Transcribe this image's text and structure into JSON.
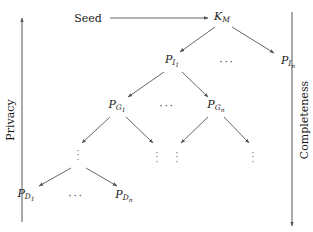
{
  "figure": {
    "type": "tree-diagram",
    "background_color": "#ffffff",
    "ink_color": "#1a1a1a",
    "line_color": "#555555"
  },
  "axes": {
    "left": {
      "label": "Privacy",
      "arrow_direction": "up",
      "x": 22,
      "y_top": 18,
      "y_bottom": 222
    },
    "right": {
      "label": "Completeness",
      "arrow_direction": "down",
      "x": 292,
      "y_top": 12,
      "y_bottom": 226
    }
  },
  "nodes": [
    {
      "id": "seed",
      "label": "Seed",
      "base": "Seed",
      "sub": "",
      "subsub": "",
      "style": "upright",
      "x": 88,
      "y": 18
    },
    {
      "id": "km",
      "label": "K_M",
      "base": "K",
      "sub": "M",
      "subsub": "",
      "style": "italic",
      "x": 222,
      "y": 17
    },
    {
      "id": "pi1",
      "label": "P_I1",
      "base": "P",
      "sub": "I",
      "subsub": "1",
      "style": "italic",
      "x": 172,
      "y": 61
    },
    {
      "id": "pin",
      "label": "P_In",
      "base": "P",
      "sub": "I",
      "subsub": "n",
      "style": "italic",
      "x": 288,
      "y": 62
    },
    {
      "id": "pg1",
      "label": "P_G1",
      "base": "P",
      "sub": "G",
      "subsub": "1",
      "style": "italic",
      "x": 117,
      "y": 106
    },
    {
      "id": "pgn",
      "label": "P_Gn",
      "base": "P",
      "sub": "G",
      "subsub": "n",
      "style": "italic",
      "x": 216,
      "y": 106
    },
    {
      "id": "pd1",
      "label": "P_D1",
      "base": "P",
      "sub": "D",
      "subsub": "1",
      "style": "italic",
      "x": 26,
      "y": 195
    },
    {
      "id": "pdn",
      "label": "P_Dn",
      "base": "P",
      "sub": "D",
      "subsub": "n",
      "style": "italic",
      "x": 124,
      "y": 196
    }
  ],
  "horizontal_ellipses": [
    {
      "id": "hdots-row-i",
      "text": "···",
      "x": 227,
      "y": 62
    },
    {
      "id": "hdots-row-g",
      "text": "···",
      "x": 167,
      "y": 106
    },
    {
      "id": "hdots-row-d",
      "text": "···",
      "x": 76,
      "y": 196
    }
  ],
  "vertical_ellipses": [
    {
      "id": "vdots-1",
      "x": 78,
      "y": 155
    },
    {
      "id": "vdots-2",
      "x": 157,
      "y": 157
    },
    {
      "id": "vdots-3",
      "x": 177,
      "y": 157
    },
    {
      "id": "vdots-4",
      "x": 253,
      "y": 157
    }
  ],
  "edges": [
    {
      "id": "seed-to-km",
      "kind": "horizontal-arrow",
      "from": "seed",
      "to": "km",
      "x1": 110,
      "y1": 18,
      "x2": 208,
      "y2": 18
    },
    {
      "id": "km-to-pi1",
      "kind": "arrow",
      "from": "km",
      "to": "pi1",
      "x1": 215,
      "y1": 27,
      "x2": 180,
      "y2": 52
    },
    {
      "id": "km-to-pin",
      "kind": "arrow",
      "from": "km",
      "to": "pin",
      "x1": 232,
      "y1": 27,
      "x2": 274,
      "y2": 53
    },
    {
      "id": "pi1-to-pg1",
      "kind": "arrow",
      "from": "pi1",
      "to": "pg1",
      "x1": 164,
      "y1": 72,
      "x2": 128,
      "y2": 97
    },
    {
      "id": "pi1-to-pgn",
      "kind": "arrow",
      "from": "pi1",
      "to": "pgn",
      "x1": 182,
      "y1": 72,
      "x2": 208,
      "y2": 97
    },
    {
      "id": "pg1-to-v1",
      "kind": "arrow",
      "from": "pg1",
      "to": "vdots-1",
      "x1": 110,
      "y1": 117,
      "x2": 82,
      "y2": 143
    },
    {
      "id": "pg1-to-v2",
      "kind": "arrow",
      "from": "pg1",
      "to": "vdots-2",
      "x1": 126,
      "y1": 117,
      "x2": 153,
      "y2": 143
    },
    {
      "id": "pgn-to-v3",
      "kind": "arrow",
      "from": "pgn",
      "to": "vdots-3",
      "x1": 208,
      "y1": 117,
      "x2": 181,
      "y2": 143
    },
    {
      "id": "pgn-to-v4",
      "kind": "arrow",
      "from": "pgn",
      "to": "vdots-4",
      "x1": 224,
      "y1": 117,
      "x2": 249,
      "y2": 143
    },
    {
      "id": "v1-to-pd1",
      "kind": "arrow",
      "from": "vdots-1",
      "to": "pd1",
      "x1": 71,
      "y1": 168,
      "x2": 39,
      "y2": 186
    },
    {
      "id": "v1-to-pdn",
      "kind": "arrow",
      "from": "vdots-1",
      "to": "pdn",
      "x1": 86,
      "y1": 168,
      "x2": 117,
      "y2": 186
    }
  ]
}
